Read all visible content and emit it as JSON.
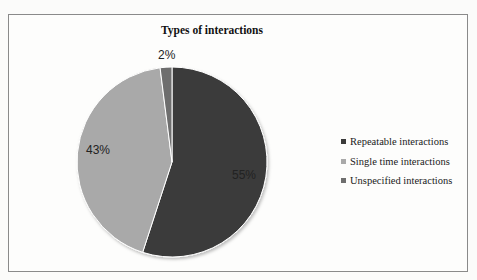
{
  "chart_data": {
    "type": "pie",
    "title": "Types of interactions",
    "categories": [
      "Repeatable interactions",
      "Single time interactions",
      "Unspecified interactions"
    ],
    "values": [
      55,
      43,
      2
    ],
    "data_labels": [
      "55%",
      "43%",
      "2%"
    ],
    "colors": [
      "#3a3a3a",
      "#a9a9a9",
      "#6e6e6e"
    ],
    "legend_position": "right",
    "start_angle": "12 o'clock, clockwise"
  },
  "labels": {
    "repeatable": "55%",
    "single": "43%",
    "unspecified": "2%"
  },
  "legend": {
    "items": [
      {
        "label": "Repeatable interactions",
        "color": "#3a3a3a"
      },
      {
        "label": "Single time interactions",
        "color": "#a9a9a9"
      },
      {
        "label": "Unspecified interactions",
        "color": "#6e6e6e"
      }
    ]
  }
}
